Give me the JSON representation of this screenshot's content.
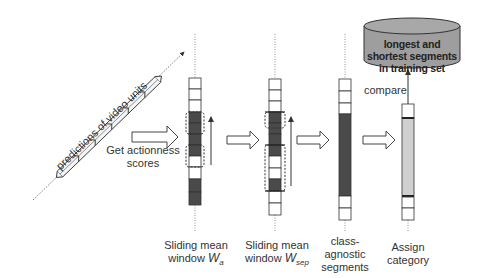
{
  "diagram": {
    "input": {
      "label": "predictions of video units",
      "units": 6
    },
    "arrow_labels": {
      "get_actionness": "Get actionness",
      "scores": "scores",
      "compare": "compare"
    },
    "database": {
      "line1": "longest and",
      "line2": "shortest segments",
      "line3": "in training set",
      "fill": "#9e9e9e"
    },
    "columns": [
      {
        "id": "wa",
        "label_line1": "Sliding mean",
        "label_line2": "window",
        "symbol": "W",
        "subscript": "a",
        "cells": [
          "w",
          "w",
          "w",
          "d",
          "d",
          "d",
          "d",
          "w",
          "w",
          "d",
          "d"
        ]
      },
      {
        "id": "wsep",
        "label_line1": "Sliding mean",
        "label_line2": "window",
        "symbol": "W",
        "subscript": "sep",
        "cells": [
          "w",
          "w",
          "w",
          "d",
          "d",
          "d",
          "d",
          "w",
          "w",
          "d",
          "w",
          "w"
        ]
      },
      {
        "id": "class-agnostic",
        "label_line1": "class-",
        "label_line2": "agnostic",
        "label_line3": "segments",
        "cells": [
          "w",
          "w",
          "w",
          "d",
          "w",
          "w"
        ]
      },
      {
        "id": "assign",
        "label_line1": "Assign",
        "label_line2": "category",
        "cells": [
          "w",
          "g",
          "w",
          "w"
        ]
      }
    ],
    "colors": {
      "dark_cell": "#4a4a4a",
      "light_cell": "#d0d0d0",
      "stroke": "#333333"
    }
  }
}
